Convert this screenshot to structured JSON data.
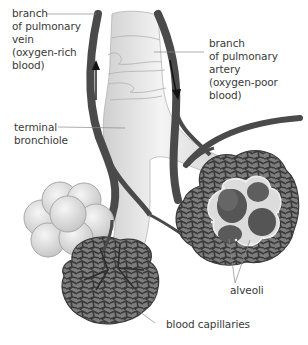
{
  "diagram": {
    "colors": {
      "vessel": "#4a4a4a",
      "bronchiole": "#e6e6e6",
      "bronchiole_shadow": "#c8c8c8",
      "alveolar_sac": "#e2e2e2",
      "capillary_fill": "#7a7a7a",
      "capillary_mesh": "#3c3c3c",
      "alveolus_interior": "#5a5a5a",
      "label_text": "#3a3a3a",
      "leader_line": "#8a8a8a"
    },
    "labels": {
      "pulmonary_vein": "branch\nof pulmonary\nvein\n(oxygen-rich\nblood)",
      "pulmonary_artery": "branch\nof pulmonary\nartery\n(oxygen-poor\nblood)",
      "terminal_bronchiole": "terminal\nbronchiole",
      "alveoli": "alveoli",
      "blood_capillaries": "blood capillaries"
    }
  }
}
